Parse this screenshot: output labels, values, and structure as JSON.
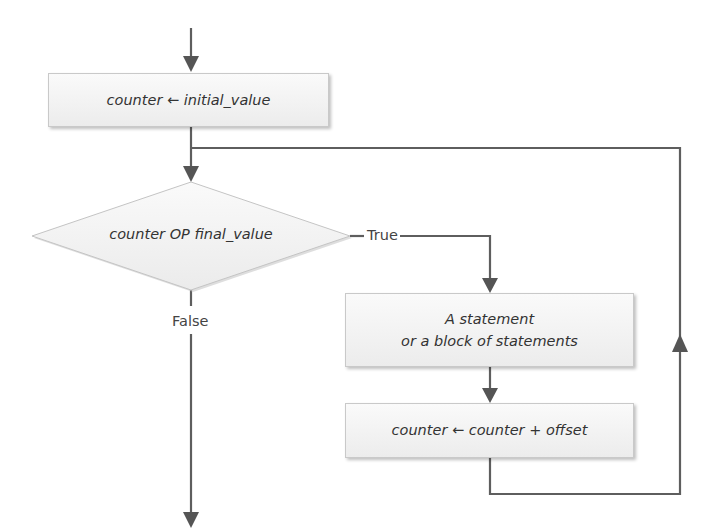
{
  "flowchart": {
    "init_box": {
      "text": "counter ← initial_value"
    },
    "condition": {
      "text": "counter OP final_value"
    },
    "true_label": "True",
    "false_label": "False",
    "body_box": {
      "line1": "A statement",
      "line2": "or a block of statements"
    },
    "update_box": {
      "text": "counter ← counter + offset"
    }
  },
  "colors": {
    "line": "#5a5a5a",
    "box_fill_top": "#fafafa",
    "box_fill_bottom": "#ececec",
    "box_border": "#c9c9c9"
  }
}
